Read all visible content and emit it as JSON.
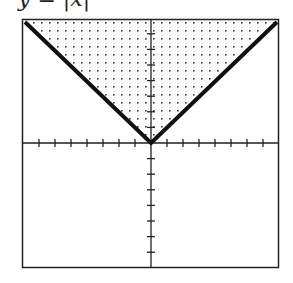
{
  "title": "y = |x|",
  "chart_data": {
    "type": "line",
    "title": "y = |x|",
    "xlabel": "",
    "ylabel": "",
    "xlim": [
      -8,
      8
    ],
    "ylim": [
      -8,
      8
    ],
    "x_ticks": [
      -7,
      -6,
      -5,
      -4,
      -3,
      -2,
      -1,
      1,
      2,
      3,
      4,
      5,
      6,
      7
    ],
    "y_ticks": [
      -7,
      -6,
      -5,
      -4,
      -3,
      -2,
      -1,
      1,
      2,
      3,
      4,
      5,
      6,
      7
    ],
    "series": [
      {
        "name": "y = |x|",
        "x": [
          -8,
          0,
          8
        ],
        "y": [
          8,
          0,
          8
        ]
      }
    ],
    "shaded_region": "y >= |x| (dotted fill above the V)",
    "grid": false,
    "legend": "none"
  },
  "colors": {
    "line": "#111111",
    "frame": "#222222",
    "dots": "#333333"
  }
}
